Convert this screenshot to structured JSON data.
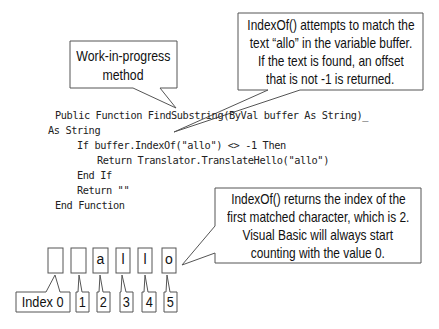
{
  "callouts": {
    "work_in_progress": {
      "lines": [
        "Work-in-progress",
        "method"
      ]
    },
    "indexof_match": {
      "lines": [
        "IndexOf() attempts to match the",
        "text “allo” in the variable buffer.",
        "If the text is found, an offset",
        "that is not -1 is returned."
      ]
    },
    "indexof_returns": {
      "lines": [
        "IndexOf() returns the index of the",
        "first matched character, which is 2.",
        "Visual Basic will always start",
        "counting with the value 0."
      ]
    }
  },
  "code": {
    "lines": [
      "Public Function FindSubstring(ByVal buffer As String)_",
      "As String",
      "If buffer.IndexOf(\"allo\") <> -1 Then",
      "Return Translator.TranslateHello(\"allo\")",
      "End If",
      "Return \"\"",
      "End Function"
    ]
  },
  "character_boxes": [
    "",
    "",
    "a",
    "l",
    "l",
    "o"
  ],
  "index_labels": [
    "Index 0",
    "1",
    "2",
    "3",
    "4",
    "5"
  ],
  "colors": {
    "stroke": "#555555",
    "text": "#111111"
  }
}
